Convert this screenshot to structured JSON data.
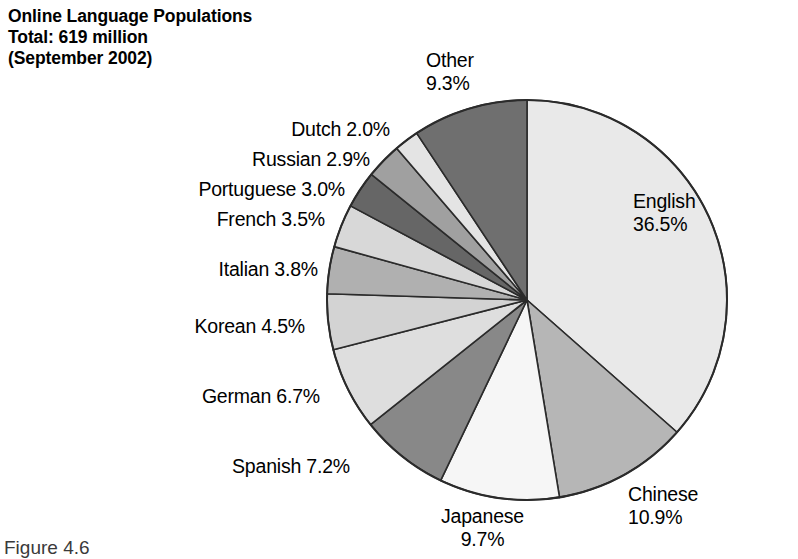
{
  "title": {
    "line1": "Online Language Populations",
    "line2": "Total: 619 million",
    "line3": "(September 2002)"
  },
  "caption": "Figure 4.6",
  "labels": {
    "english": {
      "name": "English",
      "value": "36.5%"
    },
    "chinese": {
      "name": "Chinese",
      "value": "10.9%"
    },
    "japanese": {
      "name": "Japanese",
      "value": "9.7%"
    },
    "spanish": {
      "name": "Spanish",
      "value": "7.2%"
    },
    "german": {
      "name": "German",
      "value": "6.7%"
    },
    "korean": {
      "name": "Korean",
      "value": "4.5%"
    },
    "italian": {
      "name": "Italian",
      "value": "3.8%"
    },
    "french": {
      "name": "French",
      "value": "3.5%"
    },
    "portuguese": {
      "name": "Portuguese",
      "value": "3.0%"
    },
    "russian": {
      "name": "Russian",
      "value": "2.9%"
    },
    "dutch": {
      "name": "Dutch",
      "value": "2.0%"
    },
    "other": {
      "name": "Other",
      "value": "9.3%"
    }
  },
  "chart_data": {
    "type": "pie",
    "title": "Online Language Populations Total: 619 million (September 2002)",
    "total_label": "619 million",
    "date_label": "September 2002",
    "unit": "percent",
    "start_angle_deg": 0,
    "direction": "clockwise",
    "legend": "none (direct labels)",
    "grid": false,
    "categories": [
      "English",
      "Chinese",
      "Japanese",
      "Spanish",
      "German",
      "Korean",
      "Italian",
      "French",
      "Portuguese",
      "Russian",
      "Dutch",
      "Other"
    ],
    "values": [
      36.5,
      10.9,
      9.7,
      7.2,
      6.7,
      4.5,
      3.8,
      3.5,
      3.0,
      2.9,
      2.0,
      9.3
    ],
    "colors": [
      "#e9e9e9",
      "#b6b6b6",
      "#f6f6f6",
      "#888888",
      "#dedede",
      "#d3d3d3",
      "#b0b0b0",
      "#d8d8d8",
      "#666666",
      "#a0a0a0",
      "#e4e4e4",
      "#6f6f6f"
    ],
    "slices": [
      {
        "label": "English",
        "value": 36.5,
        "color": "#e9e9e9"
      },
      {
        "label": "Chinese",
        "value": 10.9,
        "color": "#b6b6b6"
      },
      {
        "label": "Japanese",
        "value": 9.7,
        "color": "#f6f6f6"
      },
      {
        "label": "Spanish",
        "value": 7.2,
        "color": "#888888"
      },
      {
        "label": "German",
        "value": 6.7,
        "color": "#dedede"
      },
      {
        "label": "Korean",
        "value": 4.5,
        "color": "#d3d3d3"
      },
      {
        "label": "Italian",
        "value": 3.8,
        "color": "#b0b0b0"
      },
      {
        "label": "French",
        "value": 3.5,
        "color": "#d8d8d8"
      },
      {
        "label": "Portuguese",
        "value": 3.0,
        "color": "#666666"
      },
      {
        "label": "Russian",
        "value": 2.9,
        "color": "#a0a0a0"
      },
      {
        "label": "Dutch",
        "value": 2.0,
        "color": "#e4e4e4"
      },
      {
        "label": "Other",
        "value": 9.3,
        "color": "#6f6f6f"
      }
    ],
    "geometry": {
      "cx": 527,
      "cy": 300,
      "r": 200
    }
  }
}
